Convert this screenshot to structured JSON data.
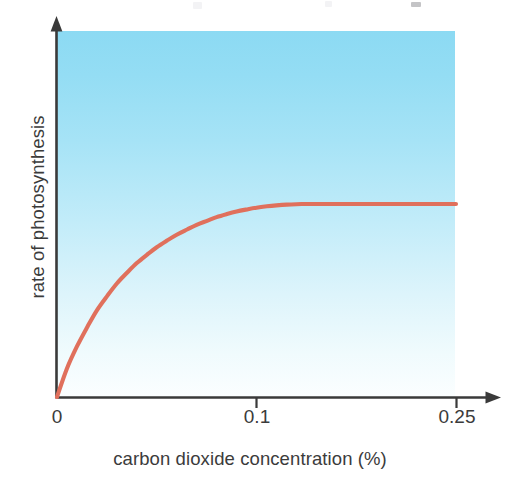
{
  "chart_data": {
    "type": "line",
    "title": "",
    "subtitle": "",
    "xlabel": "carbon dioxide concentration (%)",
    "ylabel": "rate of photosynthesis",
    "xlim": [
      0,
      0.25
    ],
    "ylim": [
      0,
      1
    ],
    "grid": false,
    "legend": null,
    "x_ticks": [
      {
        "value": 0,
        "label": "0"
      },
      {
        "value": 0.1,
        "label": "0.1"
      },
      {
        "value": 0.25,
        "label": "0.25"
      }
    ],
    "y_ticks": [],
    "series": [
      {
        "name": "rate of photosynthesis",
        "color": "#e0705c",
        "x": [
          0,
          0.006,
          0.0125,
          0.019,
          0.025,
          0.0315,
          0.0375,
          0.044,
          0.05,
          0.0565,
          0.0625,
          0.069,
          0.075,
          0.0815,
          0.0875,
          0.094,
          0.1,
          0.1065,
          0.1125,
          0.119,
          0.125,
          0.1315,
          0.1375,
          0.144,
          0.15,
          0.1565,
          0.1625,
          0.169,
          0.175,
          0.1875,
          0.2,
          0.2125,
          0.225,
          0.2375,
          0.25
        ],
        "y": [
          0,
          0.143,
          0.262,
          0.363,
          0.449,
          0.524,
          0.588,
          0.645,
          0.694,
          0.738,
          0.776,
          0.811,
          0.841,
          0.868,
          0.892,
          0.913,
          0.932,
          0.948,
          0.961,
          0.972,
          0.981,
          0.988,
          0.993,
          0.997,
          0.999,
          1.0,
          1.0,
          1.0,
          1.0,
          1.0,
          1.0,
          1.0,
          1.0,
          1.0,
          1.0
        ],
        "shape": "saturation-curve",
        "plateau_starts_at_x": 0.155,
        "annotation": "rate rises steeply then plateaus (saturates) as CO2 concentration increases"
      }
    ],
    "plot_background": {
      "type": "vertical-gradient",
      "top_color": "#8cdaf3",
      "bottom_color": "#fbfeff"
    },
    "axis_style": {
      "color": "#3a3a3a",
      "arrow_heads": true,
      "spines": [
        "left",
        "bottom"
      ]
    }
  }
}
